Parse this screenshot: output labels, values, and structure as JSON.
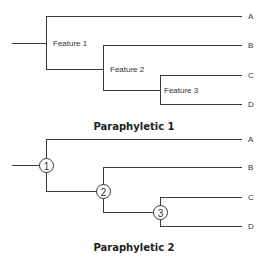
{
  "diagrams": [
    {
      "title": "Paraphyletic 1",
      "taxa": [
        "A",
        "B",
        "C",
        "D"
      ],
      "node_labels": [
        "Feature 1",
        "Feature 2",
        "Feature 3"
      ]
    },
    {
      "title": "Paraphyletic 2",
      "taxa": [
        "A",
        "B",
        "C",
        "D"
      ],
      "node_labels": [
        "1",
        "2",
        "3"
      ]
    }
  ],
  "colors": {
    "line": "#3a3a3a",
    "text": "#333333",
    "background": "#ffffff"
  }
}
